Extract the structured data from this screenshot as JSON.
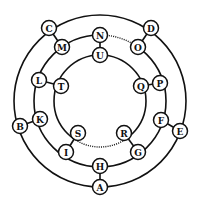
{
  "diagram": {
    "type": "concentric-rings-letter-puzzle",
    "center": [
      100,
      101
    ],
    "rings": [
      {
        "name": "outer",
        "radius": 86
      },
      {
        "name": "middle",
        "radius": 66
      },
      {
        "name": "inner",
        "radius": 46
      }
    ],
    "nodes": [
      {
        "id": "C",
        "label": "C",
        "ring": "outer",
        "x": 49,
        "y": 28
      },
      {
        "id": "D",
        "label": "D",
        "ring": "outer",
        "x": 151,
        "y": 28
      },
      {
        "id": "E",
        "label": "E",
        "ring": "outer",
        "x": 180,
        "y": 131
      },
      {
        "id": "A",
        "label": "A",
        "ring": "outer",
        "x": 100,
        "y": 187
      },
      {
        "id": "B",
        "label": "B",
        "ring": "outer",
        "x": 20,
        "y": 126
      },
      {
        "id": "M",
        "label": "M",
        "ring": "middle",
        "x": 62,
        "y": 47
      },
      {
        "id": "N",
        "label": "N",
        "ring": "middle",
        "x": 100,
        "y": 35
      },
      {
        "id": "O",
        "label": "O",
        "ring": "middle",
        "x": 138,
        "y": 47
      },
      {
        "id": "P",
        "label": "P",
        "ring": "middle",
        "x": 160,
        "y": 83
      },
      {
        "id": "F",
        "label": "F",
        "ring": "middle",
        "x": 161,
        "y": 120
      },
      {
        "id": "G",
        "label": "G",
        "ring": "middle",
        "x": 138,
        "y": 152
      },
      {
        "id": "H",
        "label": "H",
        "ring": "middle",
        "x": 100,
        "y": 166
      },
      {
        "id": "I",
        "label": "I",
        "ring": "middle",
        "x": 66,
        "y": 152
      },
      {
        "id": "K",
        "label": "K",
        "ring": "middle",
        "x": 40,
        "y": 119
      },
      {
        "id": "L",
        "label": "L",
        "ring": "middle",
        "x": 39,
        "y": 80
      },
      {
        "id": "U",
        "label": "U",
        "ring": "inner",
        "x": 100,
        "y": 55
      },
      {
        "id": "Q",
        "label": "Q",
        "ring": "inner",
        "x": 141,
        "y": 86
      },
      {
        "id": "R",
        "label": "R",
        "ring": "inner",
        "x": 124,
        "y": 133
      },
      {
        "id": "S",
        "label": "S",
        "ring": "inner",
        "x": 78,
        "y": 133
      },
      {
        "id": "T",
        "label": "T",
        "ring": "inner",
        "x": 61,
        "y": 86
      }
    ],
    "spokes": [
      [
        "C",
        "M"
      ],
      [
        "D",
        "O"
      ],
      [
        "E",
        "F"
      ],
      [
        "A",
        "H"
      ],
      [
        "B",
        "K"
      ],
      [
        "N",
        "U"
      ],
      [
        "P",
        "Q"
      ],
      [
        "G",
        "R"
      ],
      [
        "I",
        "S"
      ],
      [
        "L",
        "T"
      ]
    ],
    "dotted_arcs": [
      {
        "from": "N",
        "to": "O",
        "ring": "middle"
      },
      {
        "from": "S",
        "to": "R",
        "ring": "inner"
      }
    ]
  }
}
